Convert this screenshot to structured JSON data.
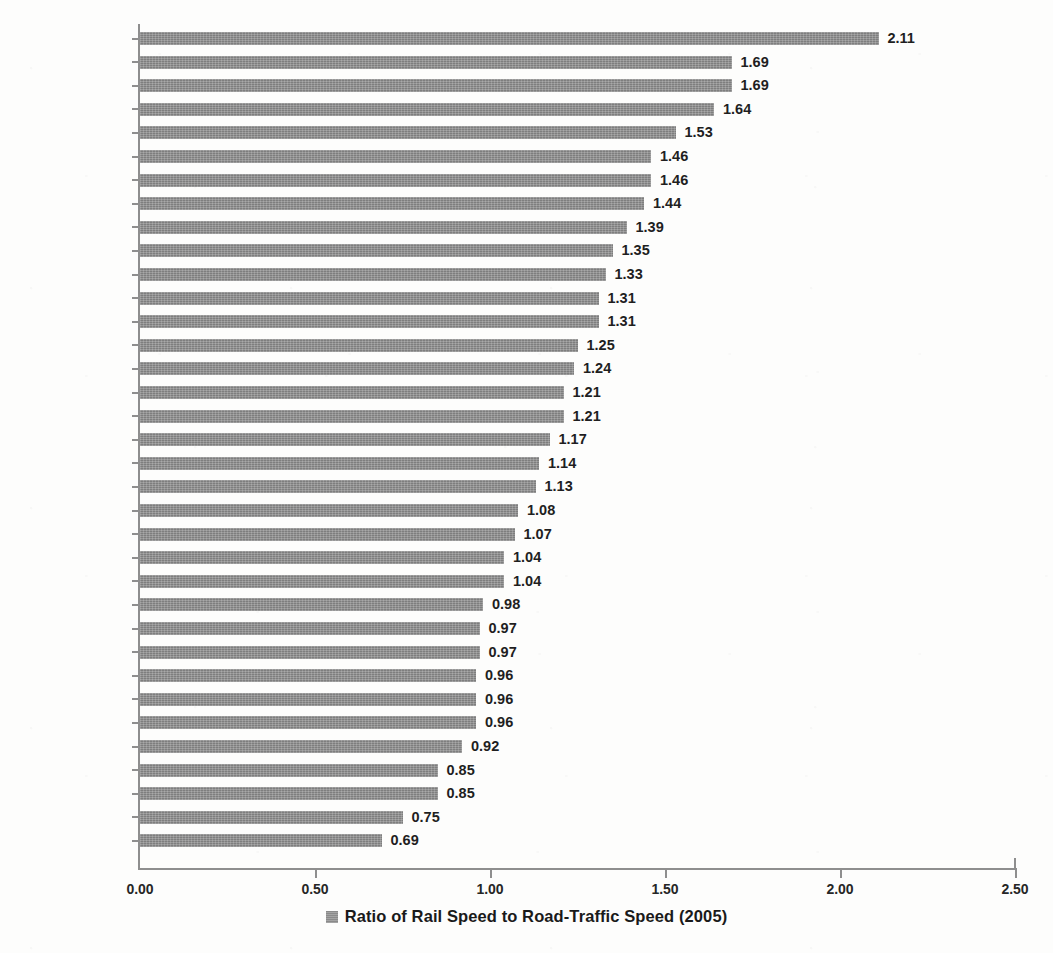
{
  "chart_data": {
    "type": "bar",
    "orientation": "horizontal",
    "title": "",
    "xlabel": "",
    "ylabel": "",
    "xlim": [
      0,
      2.5
    ],
    "xticks": [
      "0.00",
      "0.50",
      "1.00",
      "1.50",
      "2.00",
      "2.50"
    ],
    "xtick_values": [
      0,
      0.5,
      1.0,
      1.5,
      2.0,
      2.5
    ],
    "grid": false,
    "legend_position": "bottom",
    "legend": [
      "Ratio of Rail Speed to Road-Traffic Speed (2005)"
    ],
    "series_name": "Ratio of Rail Speed to Road-Traffic Speed (2005)",
    "bar_color": "#7e7e7e",
    "categories": [
      "Düsseldorf",
      "Hong Kong",
      "Bern",
      "Hamburg",
      "Stuttgart",
      "Munich",
      "Manchester",
      "London",
      "Vienna",
      "Singapore",
      "Madrid",
      "Frankfurt",
      "Perth",
      "Geneva",
      "Sydney",
      "Zurich",
      "San Diego",
      "Oslo",
      "Helsinki",
      "Brussels",
      "San Francisco",
      "Stockholm",
      "Vancouver",
      "Los Angeles",
      "Copenhagen",
      "Melbourne",
      "Berlin",
      "Atlanta",
      "Prague",
      "Brisbane",
      "Montreal",
      "Washington",
      "New York",
      "Toronto",
      "Chicago"
    ],
    "values": [
      2.11,
      1.69,
      1.69,
      1.64,
      1.53,
      1.46,
      1.46,
      1.44,
      1.39,
      1.35,
      1.33,
      1.31,
      1.31,
      1.25,
      1.24,
      1.21,
      1.21,
      1.17,
      1.14,
      1.13,
      1.08,
      1.07,
      1.04,
      1.04,
      0.98,
      0.97,
      0.97,
      0.96,
      0.96,
      0.96,
      0.92,
      0.85,
      0.85,
      0.75,
      0.69
    ],
    "value_labels": [
      "2.11",
      "1.69",
      "1.69",
      "1.64",
      "1.53",
      "1.46",
      "1.46",
      "1.44",
      "1.39",
      "1.35",
      "1.33",
      "1.31",
      "1.31",
      "1.25",
      "1.24",
      "1.21",
      "1.21",
      "1.17",
      "1.14",
      "1.13",
      "1.08",
      "1.07",
      "1.04",
      "1.04",
      "0.98",
      "0.97",
      "0.97",
      "0.96",
      "0.96",
      "0.96",
      "0.92",
      "0.85",
      "0.85",
      "0.75",
      "0.69"
    ]
  }
}
